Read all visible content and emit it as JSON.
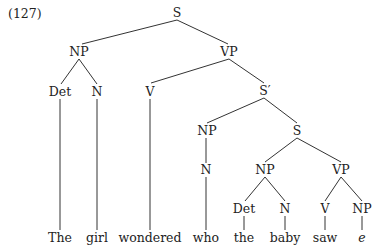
{
  "example_number": "(127)",
  "nodes": {
    "s_root": "S",
    "np_subj": "NP",
    "vp_main": "VP",
    "det_subj": "Det",
    "n_subj": "N",
    "v_main": "V",
    "s_bar": "S′",
    "np_wh": "NP",
    "s_embedded": "S",
    "n_wh": "N",
    "np_emb_subj": "NP",
    "vp_emb": "VP",
    "det_emb": "Det",
    "n_emb": "N",
    "v_emb": "V",
    "np_trace": "NP"
  },
  "words": [
    "The",
    "girl",
    "wondered",
    "who",
    "the",
    "baby",
    "saw",
    "e"
  ],
  "sentence": "The girl wondered who the baby saw e"
}
